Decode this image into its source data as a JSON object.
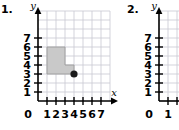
{
  "page": {
    "background_color": "#ffffff",
    "width": 179,
    "height": 130
  },
  "style": {
    "grid_line_color": "#c8c8d2",
    "axis_color": "#000000",
    "shape_fill_color": "#c9c9c9",
    "shape_stroke_color": "#8c8c8c",
    "point_color": "#1a1a1a"
  },
  "problems": [
    {
      "number": "1.",
      "axis": {
        "x_label": "x",
        "y_label": "y",
        "origin_label": "0",
        "x_ticks": [
          "1",
          "2",
          "3",
          "4",
          "5",
          "6",
          "7"
        ],
        "y_ticks": [
          "7",
          "6",
          "5",
          "4",
          "3",
          "2",
          "1"
        ],
        "x_min": 0,
        "x_max": 7,
        "y_min": 0,
        "y_max": 7
      },
      "figure": {
        "type": "polygon",
        "name": "l-shaped-figure",
        "vertices": [
          [
            1,
            6
          ],
          [
            3,
            6
          ],
          [
            3,
            4
          ],
          [
            4,
            4
          ],
          [
            4,
            3
          ],
          [
            1,
            3
          ]
        ]
      },
      "point": {
        "name": "plotted-point",
        "x": 4,
        "y": 3
      }
    },
    {
      "number": "2.",
      "axis": {
        "x_label": "",
        "y_label": "y",
        "origin_label": "0",
        "x_ticks": [
          "1"
        ],
        "y_ticks": [
          "7",
          "6",
          "5",
          "4",
          "3",
          "2",
          "1"
        ],
        "x_min": 0,
        "x_max": 1,
        "y_min": 0,
        "y_max": 7
      },
      "figure": null,
      "point": null
    }
  ]
}
